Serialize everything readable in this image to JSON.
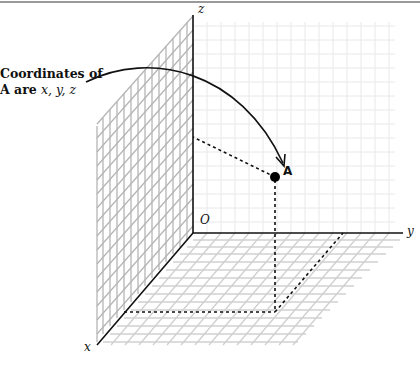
{
  "diagram": {
    "callout": {
      "line1": "Coordinates of",
      "line2_prefix": "A are ",
      "line2_vars": "x, y, z"
    },
    "axes": {
      "x_label": "x",
      "y_label": "y",
      "z_label": "z",
      "origin_label": "O"
    },
    "point": {
      "label": "A"
    },
    "colors": {
      "axis": "#111111",
      "grid_back": "#e6e6e6",
      "grid_side": "#b8b8b8",
      "grid_floor": "#cfcfcf",
      "dashed": "#111111",
      "border": "#9a9a9a"
    }
  }
}
